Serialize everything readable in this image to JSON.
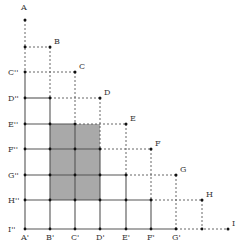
{
  "diagram": {
    "shade_color": "#a9a9a9",
    "line_color": "#555555",
    "points": [
      {
        "name": "A",
        "x": 25,
        "y": 20
      },
      {
        "name": "B",
        "x": 50,
        "y": 47
      },
      {
        "name": "C",
        "x": 75,
        "y": 72
      },
      {
        "name": "D",
        "x": 100,
        "y": 98
      },
      {
        "name": "E",
        "x": 126,
        "y": 124
      },
      {
        "name": "F",
        "x": 151,
        "y": 149
      },
      {
        "name": "G",
        "x": 176,
        "y": 175
      },
      {
        "name": "H",
        "x": 202,
        "y": 200
      },
      {
        "name": "I",
        "x": 228,
        "y": 229
      }
    ],
    "x_axis_labels": [
      "A'",
      "B'",
      "C'",
      "D'",
      "E'",
      "F'",
      "G'"
    ],
    "y_axis_labels": [
      "C''",
      "D''",
      "E''",
      "F''",
      "G''",
      "H''",
      "I''"
    ],
    "shaded_region": {
      "from": "B'",
      "to": "D'",
      "top": "E''",
      "bottom": "H''"
    }
  }
}
